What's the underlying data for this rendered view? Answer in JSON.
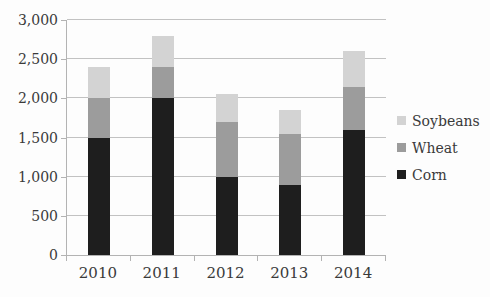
{
  "chart_data": {
    "type": "bar",
    "stacked": true,
    "title": "",
    "xlabel": "",
    "ylabel": "",
    "categories": [
      "2010",
      "2011",
      "2012",
      "2013",
      "2014"
    ],
    "series": [
      {
        "name": "Corn",
        "color": "#1e1e1e",
        "values": [
          1500,
          2000,
          1000,
          900,
          1600
        ]
      },
      {
        "name": "Wheat",
        "color": "#9c9c9c",
        "values": [
          500,
          400,
          700,
          650,
          550
        ]
      },
      {
        "name": "Soybeans",
        "color": "#d3d3d3",
        "values": [
          400,
          400,
          350,
          300,
          450
        ]
      }
    ],
    "stack_totals": [
      2400,
      2800,
      2050,
      1850,
      2600
    ],
    "ylim": [
      0,
      3000
    ],
    "ytick_step": 500,
    "ytick_labels": [
      "0",
      "500",
      "1,000",
      "1,500",
      "2,000",
      "2,500",
      "3,000"
    ],
    "grid": true,
    "legend_position": "right",
    "legend_order": [
      "Soybeans",
      "Wheat",
      "Corn"
    ]
  },
  "colors": {
    "background": "#fdfdfd",
    "gridline": "#c2c2c2",
    "axis": "#b3b3b3",
    "text": "#3a3a3a"
  }
}
